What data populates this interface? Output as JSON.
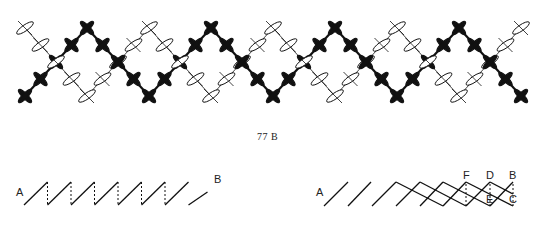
{
  "figure": {
    "caption": "77 B",
    "colors": {
      "ink": "#111111",
      "paper": "#ffffff"
    }
  },
  "pattern": {
    "columns": 33,
    "rows": 5,
    "origin_x": 25,
    "col_spacing": 15.5,
    "row_y": [
      28,
      45,
      62,
      79,
      96
    ],
    "period": 8,
    "black_zigzag": "starts bottom at col 0, peaks top at col 4, bottom at col 8",
    "white_zigzag": "starts top at col 0, bottom at col 4, top at col 8",
    "crossing_on_top": [
      "white",
      "black"
    ]
  },
  "left_diagram": {
    "labels": {
      "start": "A",
      "end": "B"
    },
    "description": "running stitches with dashed returns",
    "segments": 7
  },
  "right_diagram": {
    "labels": {
      "start": "A",
      "f": "F",
      "d": "D",
      "b": "B",
      "e": "E",
      "c": "C"
    },
    "description": "diagonal strokes building interlaced zigzag"
  }
}
